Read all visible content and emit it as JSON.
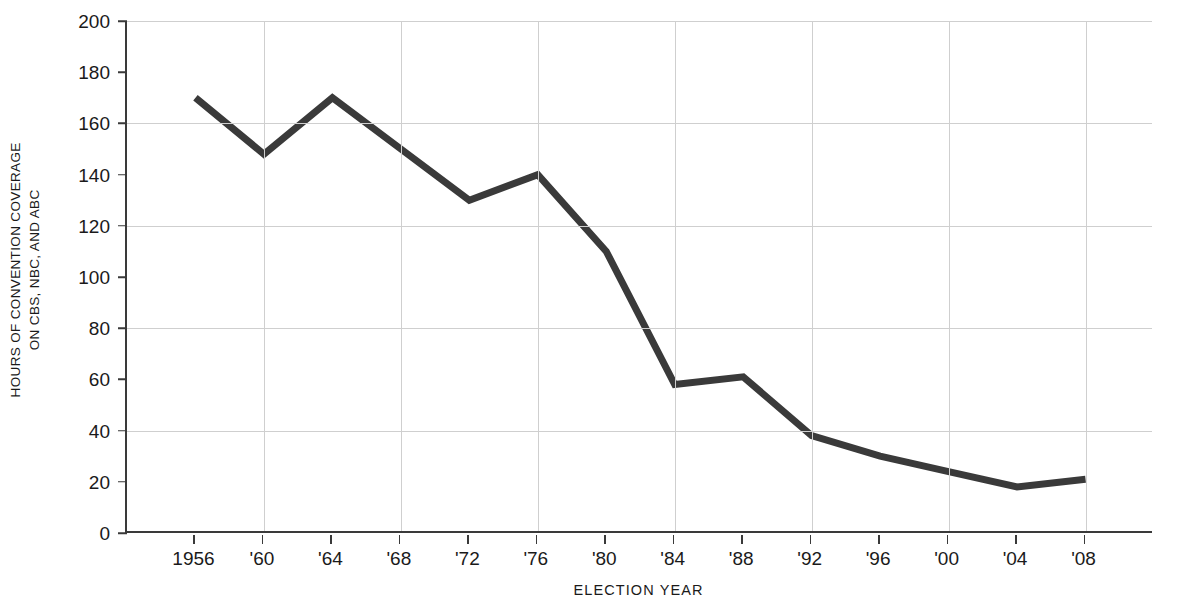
{
  "chart_data": {
    "type": "line",
    "title": "",
    "subtitle": "",
    "xlabel": "ELECTION YEAR",
    "ylabel_lines": [
      "HOURS OF CONVENTION COVERAGE",
      "ON CBS, NBC, AND ABC"
    ],
    "ylabel": "HOURS OF CONVENTION COVERAGE ON CBS, NBC, AND ABC",
    "categories": [
      "1956",
      "'60",
      "'64",
      "'68",
      "'72",
      "'76",
      "'80",
      "'84",
      "'88",
      "'92",
      "'96",
      "'00",
      "'04",
      "'08"
    ],
    "values": [
      170,
      148,
      170,
      150,
      130,
      140,
      110,
      58,
      61,
      38,
      30,
      24,
      18,
      21
    ],
    "series": [
      {
        "name": "Hours of convention coverage on CBS, NBC, and ABC",
        "values": [
          170,
          148,
          170,
          150,
          130,
          140,
          110,
          58,
          61,
          38,
          30,
          24,
          18,
          21
        ]
      }
    ],
    "ylim": [
      0,
      200
    ],
    "ytick_values": [
      0,
      20,
      40,
      60,
      80,
      100,
      120,
      140,
      160,
      180,
      200
    ],
    "ytick_labels": [
      "0",
      "20",
      "40",
      "60",
      "80",
      "100",
      "120",
      "140",
      "160",
      "180",
      "200"
    ],
    "gridlines_y": [
      40,
      80,
      120,
      160,
      200
    ],
    "gridlines_x": [
      "'60",
      "'68",
      "'76",
      "'84",
      "'92",
      "'00",
      "'08"
    ],
    "grid": true,
    "legend": "none",
    "line_color": "#3a3a3a",
    "grid_color": "#cfcfcf",
    "axis_color": "#3a3a3a",
    "background_color": "#ffffff",
    "line_width": 7,
    "annotations": []
  }
}
